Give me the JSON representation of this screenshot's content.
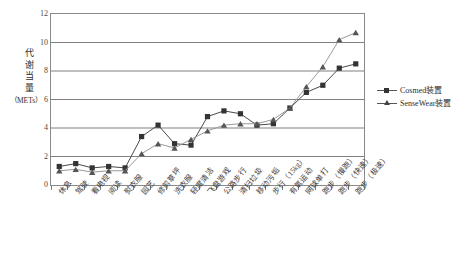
{
  "chart_data": {
    "type": "line",
    "title": "",
    "xlabel": "",
    "ylabel": "代谢当量（METs）",
    "ylabel_chars": [
      "代",
      "谢",
      "当",
      "量"
    ],
    "ylabel_units": "（METs）",
    "ylim": [
      0,
      12
    ],
    "ytick_step": 2,
    "yticks": [
      0,
      2,
      4,
      6,
      8,
      10,
      12
    ],
    "ytick_labels": [
      "0",
      "2",
      "4",
      "6",
      "8",
      "10",
      "12"
    ],
    "grid": true,
    "grid_axis": "y",
    "legend_position": "right",
    "categories": [
      "休息",
      "驾驶",
      "看电视",
      "阅读",
      "熨衣服",
      "园艺",
      "修剪草坪",
      "洗衣服",
      "轻度清洁",
      "飞盘游戏",
      "公路步行",
      "清扫垃圾",
      "移动污垢",
      "步行（15kg）",
      "有氧运动",
      "网球单打",
      "跑步（慢跑）",
      "跑步（快速）",
      "跑步（极速）"
    ],
    "series": [
      {
        "name": "Cosmed装置",
        "marker": "square",
        "color": "#333333",
        "values": [
          1.3,
          1.5,
          1.2,
          1.3,
          1.2,
          3.4,
          4.2,
          2.9,
          2.8,
          4.8,
          5.2,
          5.0,
          4.2,
          4.3,
          5.4,
          6.5,
          7.0,
          8.2,
          8.5
        ]
      },
      {
        "name": "SenseWear装置",
        "marker": "triangle",
        "color": "#555555",
        "values": [
          1.0,
          1.1,
          0.9,
          1.0,
          1.0,
          2.2,
          2.9,
          2.6,
          3.2,
          3.8,
          4.2,
          4.3,
          4.3,
          4.6,
          5.4,
          6.9,
          8.3,
          10.2,
          10.7
        ]
      }
    ],
    "colors": {
      "axis": "#8a8a8a",
      "grid": "#808080",
      "series1": "#333333",
      "series2": "#555555",
      "text": "#3a3a3a",
      "background": "#ffffff"
    }
  },
  "legend": {
    "items": [
      {
        "label": "Cosmed装置",
        "marker": "square"
      },
      {
        "label": "SenseWear装置",
        "marker": "triangle"
      }
    ]
  }
}
